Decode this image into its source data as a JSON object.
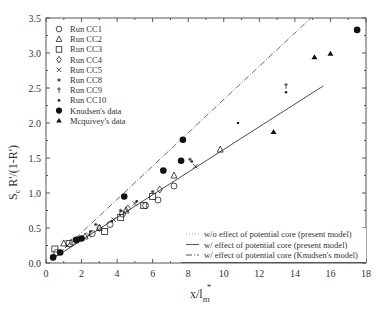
{
  "chart_data": {
    "type": "scatter",
    "title": "",
    "xlabel": "x/l_m*",
    "ylabel": "S_c R'/(1-R')",
    "xlim": [
      0,
      18
    ],
    "ylim": [
      0,
      3.5
    ],
    "xticks": [
      "0",
      "2",
      "4",
      "6",
      "8",
      "10",
      "12",
      "14",
      "16",
      "18"
    ],
    "yticks": [
      "0.0",
      "0.5",
      "1.0",
      "1.5",
      "2.0",
      "2.5",
      "3.0",
      "3.5"
    ],
    "grid": false,
    "legend_position": "upper-left",
    "series": [
      {
        "name": "Run CC1",
        "marker": "circle-open",
        "points": [
          [
            0.6,
            0.15
          ],
          [
            1.5,
            0.3
          ],
          [
            2.6,
            0.42
          ],
          [
            3.6,
            0.55
          ],
          [
            4.3,
            0.7
          ],
          [
            5.6,
            0.82
          ],
          [
            6.3,
            0.9
          ],
          [
            7.2,
            1.1
          ]
        ]
      },
      {
        "name": "Run CC2",
        "marker": "triangle-open",
        "points": [
          [
            1.0,
            0.28
          ],
          [
            2.2,
            0.38
          ],
          [
            3.0,
            0.5
          ],
          [
            4.5,
            0.75
          ],
          [
            7.2,
            1.25
          ],
          [
            9.8,
            1.62
          ]
        ]
      },
      {
        "name": "Run CC3",
        "marker": "square-open",
        "points": [
          [
            0.5,
            0.2
          ],
          [
            1.3,
            0.28
          ],
          [
            3.3,
            0.45
          ],
          [
            4.2,
            0.65
          ],
          [
            5.5,
            0.82
          ],
          [
            6.0,
            0.95
          ]
        ]
      },
      {
        "name": "Run CC4",
        "marker": "diamond-open",
        "points": [
          [
            1.8,
            0.33
          ],
          [
            3.0,
            0.5
          ],
          [
            4.6,
            0.78
          ],
          [
            6.4,
            1.05
          ]
        ]
      },
      {
        "name": "Run CC5",
        "marker": "x",
        "points": [
          [
            1.2,
            0.25
          ],
          [
            2.4,
            0.4
          ],
          [
            3.8,
            0.62
          ],
          [
            5.0,
            0.85
          ],
          [
            8.4,
            1.38
          ]
        ]
      },
      {
        "name": "Run CC8",
        "marker": "star",
        "points": [
          [
            2.8,
            0.55
          ],
          [
            4.2,
            0.75
          ],
          [
            6.0,
            1.02
          ],
          [
            8.1,
            1.48
          ]
        ]
      },
      {
        "name": "Run CC9",
        "marker": "dagger",
        "points": [
          [
            13.5,
            2.53
          ]
        ]
      },
      {
        "name": "Run CC10",
        "marker": "small-dot",
        "points": [
          [
            2.5,
            0.45
          ],
          [
            3.7,
            0.6
          ],
          [
            5.1,
            0.88
          ],
          [
            8.2,
            1.45
          ],
          [
            10.8,
            2.0
          ],
          [
            13.5,
            2.44
          ]
        ]
      },
      {
        "name": "Knudsen's data",
        "marker": "circle-filled",
        "points": [
          [
            0.4,
            0.08
          ],
          [
            0.8,
            0.15
          ],
          [
            1.7,
            0.33
          ],
          [
            2.0,
            0.35
          ],
          [
            4.4,
            0.95
          ],
          [
            6.6,
            1.32
          ],
          [
            7.6,
            1.46
          ],
          [
            7.7,
            1.76
          ],
          [
            17.5,
            3.33
          ]
        ]
      },
      {
        "name": "Mcquivey's data",
        "marker": "triangle-filled",
        "points": [
          [
            12.8,
            1.87
          ],
          [
            15.1,
            2.94
          ],
          [
            16.0,
            2.99
          ]
        ]
      },
      {
        "name": "w/o effect of potential core (present model)",
        "line": "dotted",
        "points": [
          [
            0.3,
            0.05
          ],
          [
            15.6,
            2.53
          ]
        ]
      },
      {
        "name": "w/ effect of potential core (present model)",
        "line": "solid",
        "points": [
          [
            0.3,
            0.05
          ],
          [
            15.6,
            2.53
          ]
        ]
      },
      {
        "name": "w/ effect of potential core (Knudsen's model)",
        "line": "dashdot",
        "points": [
          [
            0.3,
            0.03
          ],
          [
            14.9,
            3.5
          ]
        ]
      }
    ]
  },
  "axes": {
    "ylabel_main": "S",
    "ylabel_sub": "c",
    "ylabel_rest": " R'/(1-R')",
    "xlabel_main": "x/l",
    "xlabel_sub": "m",
    "xlabel_sup": "*"
  },
  "legend_markers": {
    "items": [
      "Run CC1",
      "Run CC2",
      "Run CC3",
      "Run CC4",
      "Run CC5",
      "Run CC8",
      "Run CC9",
      "Run CC10",
      "Knudsen's data",
      "Mcquivey's data"
    ]
  },
  "legend_lines": {
    "items": [
      "w/o effect of potential core (present model)",
      "w/ effect of potential core (present model)",
      "w/ effect of potential core (Knudsen's model)"
    ]
  }
}
